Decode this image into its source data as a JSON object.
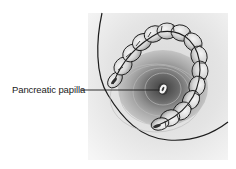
{
  "figure": {
    "type": "anatomical-illustration",
    "labels": [
      {
        "text": "Pancreatic papilla",
        "points_to": "papilla-orifice"
      }
    ],
    "colors": {
      "background": "#ffffff",
      "panel": "#e6e6e6",
      "outline": "#1c1c1c",
      "loop_fill": "#d2d2d2",
      "loop_highlight": "#f2f2f2",
      "cavity_dark": "#5a5a5a",
      "papilla_light": "#f4f4f4"
    }
  }
}
